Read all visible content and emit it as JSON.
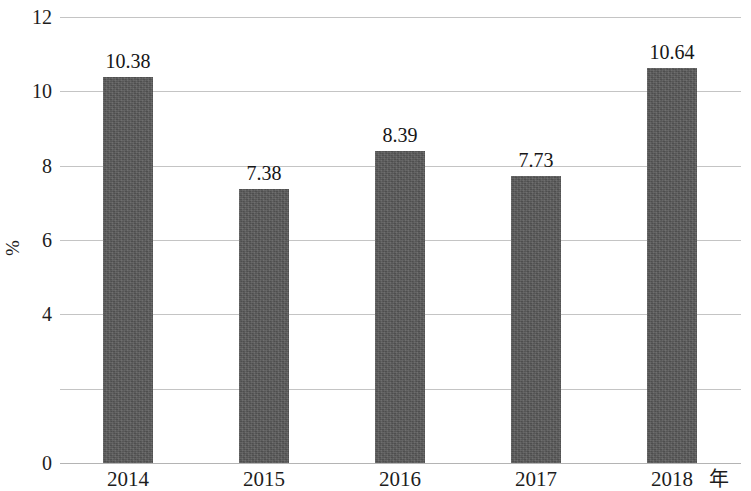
{
  "chart_data": {
    "type": "bar",
    "title": "",
    "subtitle": "",
    "xlabel": "年",
    "ylabel": "%",
    "categories": [
      "2014",
      "2015",
      "2016",
      "2017",
      "2018"
    ],
    "values": [
      10.38,
      7.38,
      8.39,
      7.73,
      10.64
    ],
    "value_labels": [
      "10.38",
      "7.38",
      "8.39",
      "7.73",
      "10.64"
    ],
    "series": [
      {
        "name": "",
        "values": [
          10.38,
          7.38,
          8.39,
          7.73,
          10.64
        ]
      }
    ],
    "ylim": [
      0,
      12
    ],
    "ytick_values": [
      12,
      10,
      8,
      6,
      4,
      2,
      0
    ],
    "ytick_labels": [
      "12",
      "10",
      "8",
      "6",
      "4",
      "",
      "0"
    ],
    "grid": true,
    "grid_axis": "y",
    "legend": false,
    "legend_position": "none",
    "bar_color": "#595959",
    "gridline_color": "#c4c4c4",
    "text_color": "#1d1d1d",
    "annotations": []
  }
}
